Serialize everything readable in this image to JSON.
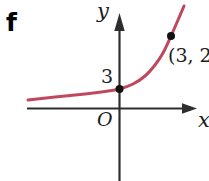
{
  "figure_label": "f",
  "axes": {
    "y_label": "y",
    "x_label": "x",
    "origin_label": "O"
  },
  "colors": {
    "background": "#ffffff",
    "curve": "#c0485e",
    "axis": "#2e2e2e",
    "dot": "#111111",
    "text": "#1c1c1c"
  },
  "points": [
    {
      "name": "y-intercept-point",
      "label": "3",
      "graph_x": 0,
      "graph_y": 3,
      "px": {
        "x": 119.5,
        "y": 89,
        "r": 4
      }
    },
    {
      "name": "marked-point",
      "label": "(3, 2",
      "graph_x": 3,
      "px": {
        "x": 171,
        "y": 36,
        "r": 4
      }
    }
  ],
  "chart_data": {
    "type": "line",
    "title": "",
    "xlabel": "x",
    "ylabel": "y",
    "grid": false,
    "legend": false,
    "key_points": [
      {
        "x": 0,
        "y": 3,
        "label": "3"
      },
      {
        "x": 3,
        "label_visible": "(3, 2"
      }
    ],
    "annotations": [
      {
        "text": "3",
        "at": "y-intercept"
      },
      {
        "text": "(3, 2",
        "at": "marked point, truncated by right image edge"
      },
      {
        "text": "O",
        "at": "origin"
      }
    ],
    "series": [
      {
        "name": "exponential-curve",
        "color": "#c0485e",
        "points_px": [
          [
            28,
            100
          ],
          [
            55,
            97
          ],
          [
            85,
            94
          ],
          [
            105,
            91.5
          ],
          [
            119.5,
            89
          ],
          [
            133,
            84
          ],
          [
            145,
            76
          ],
          [
            155,
            65
          ],
          [
            163,
            53
          ],
          [
            171,
            36
          ],
          [
            178,
            20
          ],
          [
            184,
            6
          ]
        ]
      }
    ]
  }
}
